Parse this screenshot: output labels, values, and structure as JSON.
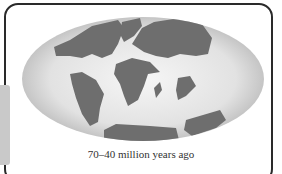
{
  "figure": {
    "caption": "70–40 million years ago",
    "colors": {
      "frame": "#2a2a2a",
      "ocean_light": "#f4f4f4",
      "ocean_edge": "#bdbdbd",
      "land": "#6e6e6e",
      "tab": "#c9c9c9"
    }
  }
}
